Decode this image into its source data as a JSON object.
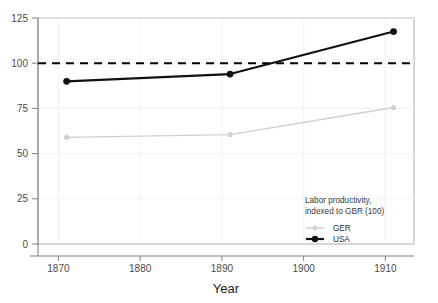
{
  "chart_data": {
    "type": "line",
    "title": "",
    "xlabel": "Year",
    "ylabel": "",
    "xlim": [
      1867.5,
      1913.5
    ],
    "ylim": [
      0,
      125
    ],
    "xticks": [
      1870,
      1880,
      1890,
      1900,
      1910
    ],
    "yticks": [
      0,
      25,
      50,
      75,
      100,
      125
    ],
    "xtick_labels": [
      "1870",
      "1880",
      "1890",
      "1900",
      "1910"
    ],
    "ytick_labels": [
      "0",
      "25",
      "50",
      "75",
      "100",
      "125"
    ],
    "grid": true,
    "legend_position": "bottom-right",
    "x": [
      1871,
      1891,
      1911
    ],
    "series": [
      {
        "name": "GER",
        "values": [
          59,
          60.5,
          75.5
        ],
        "color": "#cfcfcf",
        "marker": "circle",
        "linewidth": 1.4
      },
      {
        "name": "USA",
        "values": [
          90,
          94,
          117.5
        ],
        "color": "#111111",
        "marker": "circle",
        "linewidth": 2.2
      }
    ],
    "reference_lines": [
      {
        "name": "GBR baseline",
        "value": 100,
        "style": "dashed",
        "color": "#000000"
      }
    ],
    "annotations": []
  },
  "legend": {
    "caption_line_1": "Labor productivity,",
    "caption_line_2": "indexed to GBR (100)",
    "entries": [
      {
        "label": "GER"
      },
      {
        "label": "USA"
      }
    ]
  },
  "axis": {
    "x_title": "Year"
  }
}
